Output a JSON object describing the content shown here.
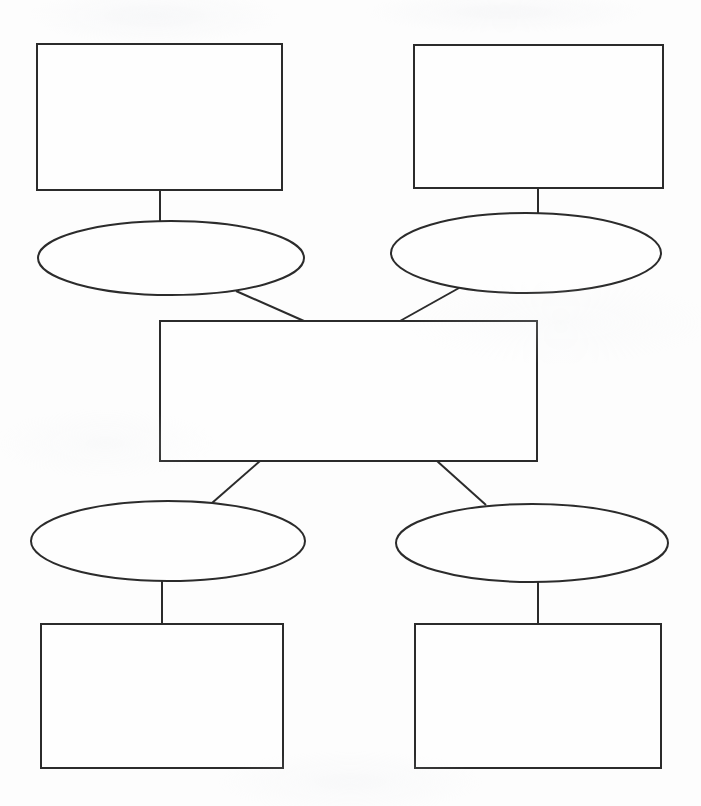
{
  "document": {
    "title": "Blank Concept Map Worksheet",
    "page_background": "#fdfdfd",
    "ink_color": "#2b2b2b",
    "shape_fill": "#fefefe"
  },
  "diagram": {
    "type": "concept-map",
    "nodes": [
      {
        "id": "top-left-box",
        "name": "top-left-box",
        "shape": "rect",
        "label": "",
        "x": 37,
        "y": 44,
        "w": 245,
        "h": 146
      },
      {
        "id": "top-right-box",
        "name": "top-right-box",
        "shape": "rect",
        "label": "",
        "x": 414,
        "y": 45,
        "w": 249,
        "h": 143
      },
      {
        "id": "top-left-ellipse",
        "name": "top-left-ellipse",
        "shape": "ellipse",
        "label": "",
        "cx": 171,
        "cy": 258,
        "rx": 133,
        "ry": 37
      },
      {
        "id": "top-right-ellipse",
        "name": "top-right-ellipse",
        "shape": "ellipse",
        "label": "",
        "cx": 526,
        "cy": 253,
        "rx": 135,
        "ry": 40
      },
      {
        "id": "center-box",
        "name": "center-box",
        "shape": "rect",
        "label": "",
        "x": 160,
        "y": 321,
        "w": 377,
        "h": 140
      },
      {
        "id": "bottom-left-ellipse",
        "name": "bottom-left-ellipse",
        "shape": "ellipse",
        "label": "",
        "cx": 168,
        "cy": 541,
        "rx": 137,
        "ry": 40
      },
      {
        "id": "bottom-right-ellipse",
        "name": "bottom-right-ellipse",
        "shape": "ellipse",
        "label": "",
        "cx": 532,
        "cy": 543,
        "rx": 136,
        "ry": 39
      },
      {
        "id": "bottom-left-box",
        "name": "bottom-left-box",
        "shape": "rect",
        "label": "",
        "x": 41,
        "y": 624,
        "w": 242,
        "h": 144
      },
      {
        "id": "bottom-right-box",
        "name": "bottom-right-box",
        "shape": "rect",
        "label": "",
        "x": 415,
        "y": 624,
        "w": 246,
        "h": 144
      }
    ],
    "edges": [
      {
        "id": "edge-top-left-box-to-ellipse",
        "name": "connector-top-left-box-to-top-left-ellipse",
        "from": "top-left-box",
        "to": "top-left-ellipse",
        "label": "",
        "x1": 160,
        "y1": 190,
        "x2": 160,
        "y2": 223
      },
      {
        "id": "edge-top-right-box-to-ellipse",
        "name": "connector-top-right-box-to-top-right-ellipse",
        "from": "top-right-box",
        "to": "top-right-ellipse",
        "label": "",
        "x1": 538,
        "y1": 188,
        "x2": 538,
        "y2": 214
      },
      {
        "id": "edge-top-left-ellipse-to-center",
        "name": "connector-top-left-ellipse-to-center-box",
        "from": "top-left-ellipse",
        "to": "center-box",
        "label": "",
        "x1": 236,
        "y1": 291,
        "x2": 304,
        "y2": 321
      },
      {
        "id": "edge-top-right-ellipse-to-center",
        "name": "connector-top-right-ellipse-to-center-box",
        "from": "top-right-ellipse",
        "to": "center-box",
        "label": "",
        "x1": 459,
        "y1": 288,
        "x2": 400,
        "y2": 321
      },
      {
        "id": "edge-center-to-bottom-left-ellipse",
        "name": "connector-center-box-to-bottom-left-ellipse",
        "from": "center-box",
        "to": "bottom-left-ellipse",
        "label": "",
        "x1": 260,
        "y1": 461,
        "x2": 212,
        "y2": 503
      },
      {
        "id": "edge-center-to-bottom-right-ellipse",
        "name": "connector-center-box-to-bottom-right-ellipse",
        "from": "center-box",
        "to": "bottom-right-ellipse",
        "label": "",
        "x1": 437,
        "y1": 461,
        "x2": 486,
        "y2": 505
      },
      {
        "id": "edge-bottom-left-ellipse-to-box",
        "name": "connector-bottom-left-ellipse-to-bottom-left-box",
        "from": "bottom-left-ellipse",
        "to": "bottom-left-box",
        "label": "",
        "x1": 162,
        "y1": 580,
        "x2": 162,
        "y2": 624
      },
      {
        "id": "edge-bottom-right-ellipse-to-box",
        "name": "connector-bottom-right-ellipse-to-bottom-right-box",
        "from": "bottom-right-ellipse",
        "to": "bottom-right-box",
        "label": "",
        "x1": 538,
        "y1": 582,
        "x2": 538,
        "y2": 624
      }
    ]
  }
}
